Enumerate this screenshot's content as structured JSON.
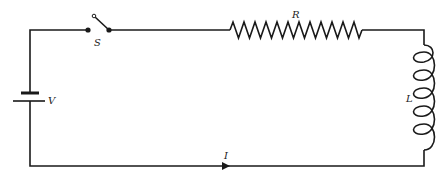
{
  "diagram": {
    "type": "circuit",
    "components": [
      {
        "id": "battery",
        "label": "V",
        "kind": "battery"
      },
      {
        "id": "switch",
        "label": "S",
        "kind": "switch",
        "state": "open"
      },
      {
        "id": "resistor",
        "label": "R",
        "kind": "resistor"
      },
      {
        "id": "inductor",
        "label": "L",
        "kind": "inductor"
      }
    ],
    "current": {
      "label": "I",
      "direction": "right"
    }
  },
  "labels": {
    "battery": "V",
    "switch": "S",
    "resistor": "R",
    "inductor": "L",
    "current": "I"
  },
  "colors": {
    "line": "#1a1a1a",
    "background": "#ffffff"
  }
}
